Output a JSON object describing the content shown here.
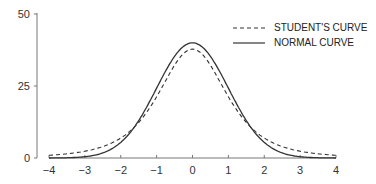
{
  "chart_data": {
    "type": "line",
    "title": "",
    "xlabel": "",
    "ylabel": "",
    "xlim": [
      -4,
      4
    ],
    "ylim": [
      0,
      50
    ],
    "x_ticks": [
      "−4",
      "−3",
      "−2",
      "−1",
      "0",
      "1",
      "2",
      "3",
      "4"
    ],
    "y_ticks": [
      "0",
      "25",
      "50"
    ],
    "grid": false,
    "legend_position": "upper right",
    "series": [
      {
        "name": "STUDENT'S CURVE",
        "style": "dashed",
        "peak": 37.8,
        "x": [
          -4,
          -3,
          -2,
          -1,
          0,
          1,
          2,
          3,
          4
        ],
        "values": [
          1.2,
          3.0,
          9.0,
          24.0,
          37.8,
          24.0,
          9.0,
          3.0,
          1.2
        ]
      },
      {
        "name": "NORMAL CURVE",
        "style": "solid",
        "peak": 40.0,
        "x": [
          -4,
          -3,
          -2,
          -1,
          0,
          1,
          2,
          3,
          4
        ],
        "values": [
          0.0,
          0.4,
          5.4,
          24.2,
          40.0,
          24.2,
          5.4,
          0.4,
          0.0
        ]
      }
    ]
  },
  "legend": {
    "student": "STUDENT'S CURVE",
    "normal": "NORMAL CURVE"
  },
  "colors": {
    "line": "#333333",
    "axis": "#666666"
  }
}
